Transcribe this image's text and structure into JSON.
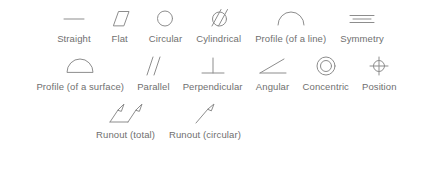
{
  "page": {
    "background_color": "#ffffff",
    "stroke_color": "#8d8d8d",
    "label_color": "#6f6f6f"
  },
  "rows": [
    {
      "items": [
        {
          "label": "Straight",
          "icon": "straightness-line-icon"
        },
        {
          "label": "Flat",
          "icon": "flatness-parallelogram-icon"
        },
        {
          "label": "Circular",
          "icon": "circularity-circle-icon"
        },
        {
          "label": "Cylindrical",
          "icon": "cylindricity-slashed-circle-icon"
        },
        {
          "label": "Profile (of a line)",
          "icon": "profile-of-a-line-arc-icon"
        },
        {
          "label": "Symmetry",
          "icon": "symmetry-three-lines-icon"
        }
      ]
    },
    {
      "items": [
        {
          "label": "Profile (of a surface)",
          "icon": "profile-of-a-surface-half-circle-icon"
        },
        {
          "label": "Parallel",
          "icon": "parallelism-two-slanted-lines-icon"
        },
        {
          "label": "Perpendicular",
          "icon": "perpendicularity-tee-icon"
        },
        {
          "label": "Angular",
          "icon": "angularity-angle-icon"
        },
        {
          "label": "Concentric",
          "icon": "concentricity-two-circles-icon"
        },
        {
          "label": "Position",
          "icon": "position-crosshair-circle-icon"
        }
      ]
    },
    {
      "items": [
        {
          "label": "Runout (total)",
          "icon": "total-runout-double-arrow-icon"
        },
        {
          "label": "Runout (circular)",
          "icon": "circular-runout-single-arrow-icon"
        }
      ]
    }
  ]
}
